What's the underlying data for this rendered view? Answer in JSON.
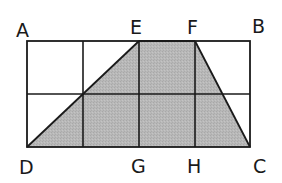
{
  "diagram": {
    "type": "geometry-grid",
    "rectangle": {
      "top_left": "A",
      "top_right": "B",
      "bottom_right": "C",
      "bottom_left": "D"
    },
    "grid": {
      "rows": 2,
      "cols": 4
    },
    "shaded_shape": {
      "name": "trapezoid",
      "vertices": [
        "D",
        "E",
        "F",
        "C"
      ]
    },
    "colors": {
      "fill": "#b5b5b5",
      "stroke": "#1a1a1a",
      "background": "#ffffff"
    },
    "labels": {
      "A": "A",
      "B": "B",
      "C": "C",
      "D": "D",
      "E": "E",
      "F": "F",
      "G": "G",
      "H": "H"
    }
  }
}
